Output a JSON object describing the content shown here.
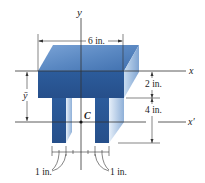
{
  "figure": {
    "axes": {
      "y_label": "y",
      "x_label": "x",
      "x_prime_label": "x′",
      "centroid_label": "C",
      "ybar_label": "ȳ"
    },
    "dimensions": {
      "width_top": "6 in.",
      "flange_thickness": "2 in.",
      "web_height": "4 in.",
      "leg_left_width": "1 in.",
      "leg_right_width": "1 in."
    },
    "colors": {
      "front_face": "#2f5f9e",
      "top_face": "#5f8fc8",
      "side_face": "#9fbde0",
      "leg_front": "#2a5a98",
      "leg_side": "#a8c4e6",
      "lines": "#333333"
    }
  }
}
